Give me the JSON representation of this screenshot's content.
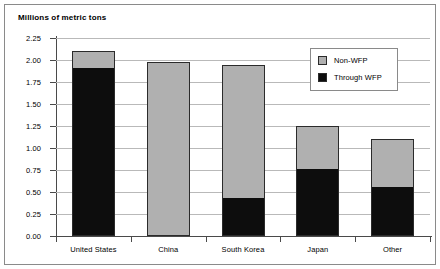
{
  "chart_data": {
    "type": "bar",
    "subtype": "stacked",
    "title": "Millions of metric tons",
    "xlabel": "",
    "ylabel": "Millions of metric tons",
    "categories": [
      "United States",
      "China",
      "South Korea",
      "Japan",
      "Other"
    ],
    "series": [
      {
        "name": "Through WFP",
        "color": "#0d0d0d",
        "values": [
          1.9,
          0.0,
          0.42,
          0.75,
          0.55
        ]
      },
      {
        "name": "Non-WFP",
        "color": "#b0b0b0",
        "values": [
          0.2,
          1.98,
          1.52,
          0.5,
          0.55
        ]
      }
    ],
    "totals": [
      2.1,
      1.98,
      1.94,
      1.25,
      1.1
    ],
    "ylim": [
      0.0,
      2.25
    ],
    "ytick_values": [
      0.0,
      0.25,
      0.5,
      0.75,
      1.0,
      1.25,
      1.5,
      1.75,
      2.0,
      2.25
    ],
    "ytick_labels": [
      "0.00",
      "0.25",
      "0.50",
      "0.75",
      "1.00",
      "1.25",
      "1.50",
      "1.75",
      "2.00",
      "2.25"
    ],
    "grid": true,
    "legend_position": "top-right",
    "legend_entries": [
      "Non-WFP",
      "Through WFP"
    ]
  },
  "legend": {
    "items": [
      {
        "label": "Non-WFP",
        "color": "#b0b0b0",
        "icon": "legend-swatch-gray"
      },
      {
        "label": "Through WFP",
        "color": "#0d0d0d",
        "icon": "legend-swatch-black"
      }
    ]
  },
  "colors": {
    "non_wfp": "#b0b0b0",
    "through_wfp": "#0d0d0d",
    "grid": "#b9b9b9",
    "axis": "#4a4a4a",
    "border": "#8a8a8a",
    "background": "#ffffff"
  }
}
